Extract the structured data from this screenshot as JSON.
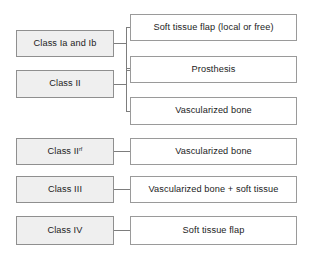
{
  "diagram": {
    "type": "flowchart",
    "colors": {
      "left_box_fill": "#efefef",
      "right_box_fill": "#ffffff",
      "border": "#8a8a8a",
      "connector": "#7d7d7d",
      "text": "#1c1c1c",
      "background": "#ffffff"
    },
    "classes": [
      {
        "id": "class-ia-ib",
        "label": "Class Ia and Ib",
        "superscript": ""
      },
      {
        "id": "class-ii",
        "label": "Class II",
        "superscript": ""
      },
      {
        "id": "class-ii-rf",
        "label": "Class II",
        "superscript": "rf"
      },
      {
        "id": "class-iii",
        "label": "Class III",
        "superscript": ""
      },
      {
        "id": "class-iv",
        "label": "Class IV",
        "superscript": ""
      }
    ],
    "treatments": [
      {
        "id": "soft-tissue-flap-local-or-free",
        "label": "Soft tissue flap (local or free)"
      },
      {
        "id": "prosthesis",
        "label": "Prosthesis"
      },
      {
        "id": "vascularized-bone-1",
        "label": "Vascularized bone"
      },
      {
        "id": "vascularized-bone-2",
        "label": "Vascularized bone"
      },
      {
        "id": "vascularized-bone-plus-soft-tissue",
        "label": "Vascularized bone + soft tissue"
      },
      {
        "id": "soft-tissue-flap",
        "label": "Soft tissue flap"
      }
    ],
    "links": [
      {
        "from": "class-ia-ib",
        "to": [
          "soft-tissue-flap-local-or-free",
          "prosthesis"
        ],
        "style": "bracket"
      },
      {
        "from": "class-ii",
        "to": [
          "prosthesis",
          "vascularized-bone-1"
        ],
        "style": "bracket"
      },
      {
        "from": "class-ii-rf",
        "to": [
          "vascularized-bone-2"
        ],
        "style": "straight"
      },
      {
        "from": "class-iii",
        "to": [
          "vascularized-bone-plus-soft-tissue"
        ],
        "style": "straight"
      },
      {
        "from": "class-iv",
        "to": [
          "soft-tissue-flap"
        ],
        "style": "straight"
      }
    ]
  }
}
